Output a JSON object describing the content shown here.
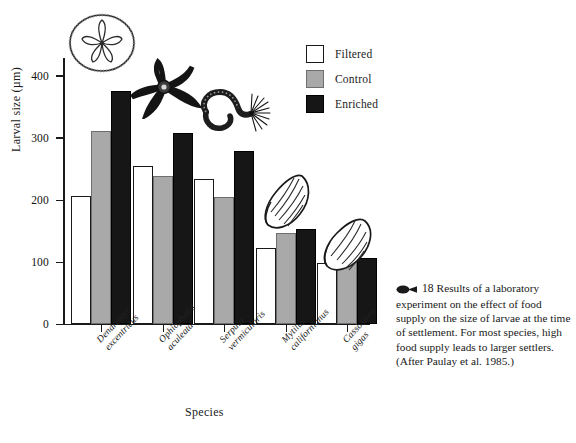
{
  "figure": {
    "number": "18",
    "caption": "Results of a laboratory experiment on the effect of food supply on the size of larvae at the time of settlement. For most species, high food supply leads to larger settlers. (After Paulay et al. 1985.)",
    "marker_icon": "larva-marker-icon"
  },
  "chart_data": {
    "type": "bar",
    "title": "",
    "xlabel": "Species",
    "ylabel": "Larval size (µm)",
    "ylim": [
      0,
      430
    ],
    "yticks": [
      0,
      100,
      200,
      300,
      400
    ],
    "grid": false,
    "legend_position": "top-right",
    "categories": [
      "Dendraster excentricus",
      "Ophiopholis aculeata",
      "Serpula vermicularis",
      "Mytilus californianus",
      "Cassostrea gigas"
    ],
    "category_lines": [
      [
        "Dendraster",
        "excentricus"
      ],
      [
        "Ophiopholis",
        "aculeata"
      ],
      [
        "Serpula",
        "vermicularis"
      ],
      [
        "Mytilus",
        "californianus"
      ],
      [
        "Cassostrea",
        "gigas"
      ]
    ],
    "series": [
      {
        "name": "Filtered",
        "color": "#ffffff",
        "values": [
          205,
          253,
          233,
          121,
          98
        ]
      },
      {
        "name": "Control",
        "color": "#a9a9a9",
        "values": [
          310,
          237,
          203,
          146,
          105
        ]
      },
      {
        "name": "Enriched",
        "color": "#161616",
        "values": [
          375,
          307,
          278,
          152,
          105
        ]
      }
    ]
  },
  "legend": {
    "items": [
      {
        "label": "Filtered",
        "key": "filtered"
      },
      {
        "label": "Control",
        "key": "control"
      },
      {
        "label": "Enriched",
        "key": "enriched"
      }
    ]
  },
  "illustrations": [
    {
      "name": "sand-dollar-illustration",
      "species": "Dendraster excentricus"
    },
    {
      "name": "brittle-star-illustration",
      "species": "Ophiopholis aculeata"
    },
    {
      "name": "tube-worm-illustration",
      "species": "Serpula vermicularis"
    },
    {
      "name": "mussel-illustration",
      "species": "Mytilus californianus"
    },
    {
      "name": "oyster-illustration",
      "species": "Cassostrea gigas"
    }
  ]
}
